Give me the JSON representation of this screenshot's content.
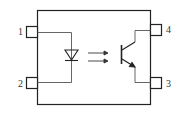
{
  "diagram": {
    "type": "optocoupler",
    "components": {
      "input": "LED (diode)",
      "coupling": "light-arrows",
      "output": "NPN phototransistor"
    },
    "pins": [
      {
        "number": "1",
        "side": "left",
        "position": "top"
      },
      {
        "number": "2",
        "side": "left",
        "position": "bottom"
      },
      {
        "number": "4",
        "side": "right",
        "position": "top"
      },
      {
        "number": "3",
        "side": "right",
        "position": "bottom"
      }
    ],
    "colors": {
      "stroke": "#222222",
      "wire": "#555555",
      "background": "#ffffff"
    }
  }
}
